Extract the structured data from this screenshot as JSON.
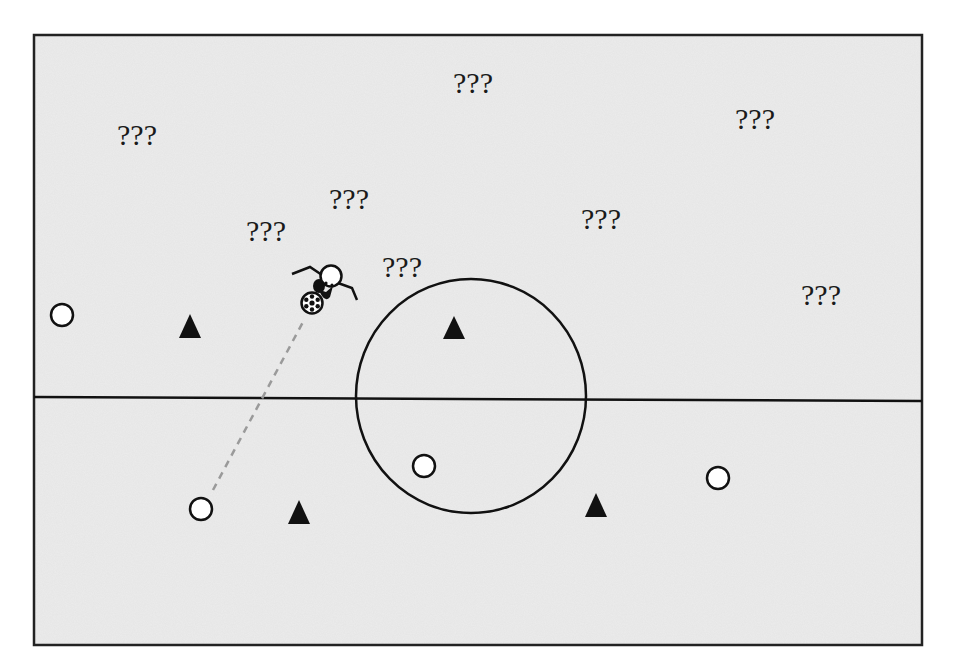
{
  "diagram": {
    "type": "soccer-field-top-view",
    "field": {
      "x": 34,
      "y": 35,
      "width": 888,
      "height": 610,
      "background": "#ececec",
      "border": "#222222"
    },
    "center_line": {
      "x1": 34,
      "y1": 397,
      "x2": 922,
      "y2": 401
    },
    "center_circle": {
      "cx": 471,
      "cy": 396,
      "rx": 115,
      "ry": 117
    },
    "unknown_labels": [
      {
        "id": "q1",
        "text": "???",
        "x": 117,
        "y": 120
      },
      {
        "id": "q2",
        "text": "???",
        "x": 453,
        "y": 68
      },
      {
        "id": "q3",
        "text": "???",
        "x": 735,
        "y": 104
      },
      {
        "id": "q4",
        "text": "???",
        "x": 329,
        "y": 184
      },
      {
        "id": "q5",
        "text": "???",
        "x": 581,
        "y": 204
      },
      {
        "id": "q6",
        "text": "???",
        "x": 246,
        "y": 216
      },
      {
        "id": "q7",
        "text": "???",
        "x": 382,
        "y": 252
      },
      {
        "id": "q8",
        "text": "???",
        "x": 801,
        "y": 280
      }
    ],
    "players_circle": [
      {
        "id": "c1",
        "cx": 62,
        "cy": 315
      },
      {
        "id": "c2",
        "cx": 201,
        "cy": 509
      },
      {
        "id": "c3",
        "cx": 424,
        "cy": 466
      },
      {
        "id": "c4",
        "cx": 718,
        "cy": 478
      }
    ],
    "players_triangle": [
      {
        "id": "t1",
        "cx": 190,
        "cy": 326
      },
      {
        "id": "t2",
        "cx": 454,
        "cy": 327
      },
      {
        "id": "t3",
        "cx": 299,
        "cy": 512
      },
      {
        "id": "t4",
        "cx": 596,
        "cy": 505
      }
    ],
    "ball_carrier": {
      "head_cx": 330,
      "head_cy": 276,
      "ball_cx": 312,
      "ball_cy": 302
    },
    "pass_line": {
      "x1": 213,
      "y1": 490,
      "x2": 303,
      "y2": 322,
      "style": "dashed",
      "color": "#9a9a9a"
    }
  }
}
